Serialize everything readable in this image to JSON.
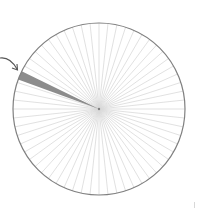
{
  "diagram": {
    "type": "divided-circle",
    "center": [
      99,
      109
    ],
    "radius": 86,
    "sector_count": 60,
    "highlighted_sector": {
      "start_angle_deg": 200,
      "end_angle_deg": 206,
      "fraction": "1/60"
    },
    "colors": {
      "outline": "#808080",
      "spokes": "#d9d9d9",
      "highlight": "#8c8c8c",
      "arrow": "#555555",
      "background": "#ffffff"
    },
    "arrow": {
      "points_to": "highlighted-sector"
    }
  }
}
